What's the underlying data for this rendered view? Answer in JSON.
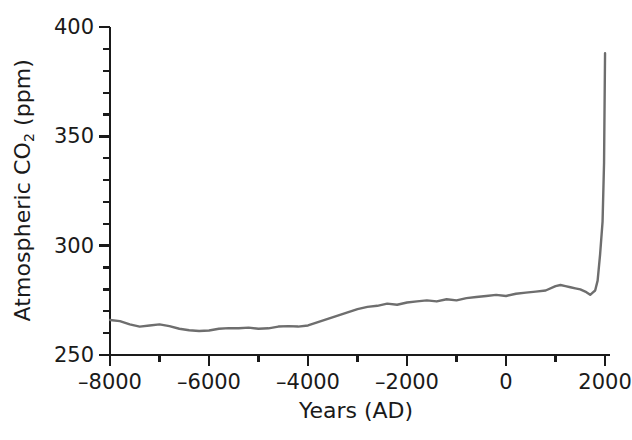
{
  "chart_data": {
    "type": "line",
    "title": "",
    "subtitle": "",
    "xlabel": "Years (AD)",
    "ylabel": "Atmospheric CO2 (ppm)",
    "ylabel_parts": {
      "prefix": "Atmospheric CO",
      "sub": "2",
      "suffix": " (ppm)"
    },
    "xlim": [
      -8000,
      2100
    ],
    "ylim": [
      250,
      400
    ],
    "x_major_ticks": [
      -8000,
      -6000,
      -4000,
      -2000,
      0,
      2000
    ],
    "x_major_tick_labels": [
      "–8000",
      "–6000",
      "–4000",
      "–2000",
      "0",
      "2000"
    ],
    "x_minor_tick_interval": 1000,
    "y_major_ticks": [
      250,
      300,
      350,
      400
    ],
    "y_major_tick_labels": [
      "250",
      "300",
      "350",
      "400"
    ],
    "y_minor_tick_interval": 10,
    "grid": false,
    "legend": null,
    "legend_position": "none",
    "line_color": "#6e6e6e",
    "axis_color": "#1a1a1a",
    "background_color": "#ffffff",
    "series": [
      {
        "name": "Atmospheric CO2",
        "color": "#6e6e6e",
        "x": [
          -8000,
          -7800,
          -7600,
          -7400,
          -7200,
          -7000,
          -6800,
          -6600,
          -6400,
          -6200,
          -6000,
          -5800,
          -5600,
          -5400,
          -5200,
          -5000,
          -4800,
          -4600,
          -4400,
          -4200,
          -4000,
          -3800,
          -3600,
          -3400,
          -3200,
          -3000,
          -2800,
          -2600,
          -2400,
          -2200,
          -2000,
          -1800,
          -1600,
          -1400,
          -1200,
          -1000,
          -800,
          -600,
          -400,
          -200,
          0,
          200,
          400,
          600,
          800,
          1000,
          1100,
          1200,
          1300,
          1400,
          1500,
          1600,
          1700,
          1750,
          1800,
          1850,
          1900,
          1950,
          1980,
          2000
        ],
        "y": [
          266.0,
          265.5,
          264.0,
          263.0,
          263.5,
          264.0,
          263.2,
          262.0,
          261.3,
          261.0,
          261.2,
          262.0,
          262.3,
          262.2,
          262.5,
          262.0,
          262.2,
          263.0,
          263.2,
          263.0,
          263.5,
          265.0,
          266.5,
          268.0,
          269.5,
          271.0,
          272.0,
          272.5,
          273.5,
          273.0,
          274.0,
          274.5,
          275.0,
          274.5,
          275.5,
          275.0,
          276.0,
          276.5,
          277.0,
          277.5,
          277.0,
          278.0,
          278.5,
          279.0,
          279.5,
          281.5,
          282.0,
          281.5,
          281.0,
          280.5,
          280.0,
          279.0,
          277.5,
          278.5,
          279.5,
          284.0,
          296.0,
          311.0,
          338.0,
          388.0
        ]
      }
    ],
    "annotations": []
  }
}
